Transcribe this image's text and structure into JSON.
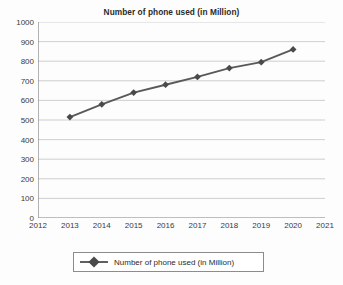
{
  "chart_data": {
    "type": "line",
    "title": "Number of phone used (in Million)",
    "xlabel": "",
    "ylabel": "",
    "x": [
      2013,
      2014,
      2015,
      2016,
      2017,
      2018,
      2019,
      2020
    ],
    "categories": [
      "2013",
      "2014",
      "2015",
      "2016",
      "2017",
      "2018",
      "2019",
      "2020"
    ],
    "series": [
      {
        "name": "Number of phone used (in Million)",
        "values": [
          515,
          580,
          640,
          680,
          720,
          765,
          795,
          860
        ],
        "color": "#595959",
        "marker": "diamond"
      }
    ],
    "xlim": [
      2012,
      2021
    ],
    "ylim": [
      0,
      1000
    ],
    "x_ticks": [
      "2012",
      "2013",
      "2014",
      "2015",
      "2016",
      "2017",
      "2018",
      "2019",
      "2020",
      "2021"
    ],
    "y_ticks": [
      "0",
      "100",
      "200",
      "300",
      "400",
      "500",
      "600",
      "700",
      "800",
      "900",
      "1000"
    ],
    "grid": "horizontal",
    "legend_position": "bottom",
    "legend_entries": [
      "Number of phone used (in Million)"
    ]
  },
  "legend": {
    "label": "Number of phone used (in Million)",
    "marker_icon": "diamond-marker-icon"
  },
  "colors": {
    "series": "#595959",
    "gridline": "#c9c9c9",
    "axis": "#808080",
    "text": "#2b2b2b",
    "background": "#fdfdfd"
  }
}
